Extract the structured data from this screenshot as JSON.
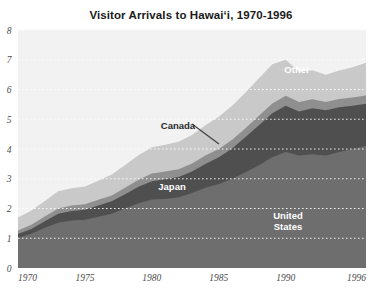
{
  "chart_data": {
    "type": "area",
    "stacked": true,
    "title": "Visitor Arrivals to Hawai‘i, 1970-1996",
    "xlabel": "",
    "ylabel": "",
    "xlim": [
      1970,
      1996
    ],
    "ylim": [
      0,
      8
    ],
    "grid": true,
    "grid_style": "dotted-white-horizontal",
    "legend_position": "inline-annotations",
    "x": [
      1970,
      1971,
      1972,
      1973,
      1974,
      1975,
      1976,
      1977,
      1978,
      1979,
      1980,
      1981,
      1982,
      1983,
      1984,
      1985,
      1986,
      1987,
      1988,
      1989,
      1990,
      1991,
      1992,
      1993,
      1994,
      1995,
      1996
    ],
    "xticks": [
      1970,
      1975,
      1980,
      1985,
      1990,
      1996
    ],
    "xticklabels": [
      "1970",
      "1975",
      "1980",
      "1985",
      "1990",
      "1996"
    ],
    "yticks": [
      0,
      1,
      2,
      3,
      4,
      5,
      6,
      7,
      8
    ],
    "yticklabels": [
      "0",
      "1",
      "2",
      "3",
      "4",
      "5",
      "6",
      "7",
      "8"
    ],
    "series": [
      {
        "name": "United States",
        "color": "#6e6e6e",
        "label_color": "#ffffff",
        "values": [
          1.02,
          1.15,
          1.35,
          1.52,
          1.6,
          1.62,
          1.72,
          1.82,
          2.0,
          2.18,
          2.3,
          2.32,
          2.38,
          2.52,
          2.7,
          2.82,
          3.0,
          3.22,
          3.45,
          3.72,
          3.9,
          3.78,
          3.82,
          3.78,
          3.9,
          4.0,
          4.1
        ]
      },
      {
        "name": "Japan",
        "color": "#4f4f4f",
        "label_color": "#ffffff",
        "values": [
          0.12,
          0.16,
          0.22,
          0.3,
          0.32,
          0.34,
          0.38,
          0.42,
          0.48,
          0.55,
          0.62,
          0.66,
          0.68,
          0.72,
          0.8,
          0.9,
          1.02,
          1.18,
          1.35,
          1.48,
          1.55,
          1.48,
          1.55,
          1.52,
          1.5,
          1.45,
          1.42
        ]
      },
      {
        "name": "Canada",
        "color": "#8f8f8f",
        "label_color": "#2b2b2b",
        "values": [
          0.12,
          0.14,
          0.16,
          0.18,
          0.18,
          0.18,
          0.19,
          0.2,
          0.22,
          0.24,
          0.26,
          0.26,
          0.26,
          0.27,
          0.28,
          0.28,
          0.29,
          0.3,
          0.32,
          0.33,
          0.34,
          0.32,
          0.3,
          0.28,
          0.28,
          0.28,
          0.28
        ]
      },
      {
        "name": "Other",
        "color": "#c9c9c9",
        "label_color": "#ffffff",
        "values": [
          0.44,
          0.48,
          0.52,
          0.58,
          0.58,
          0.6,
          0.64,
          0.7,
          0.76,
          0.82,
          0.88,
          0.9,
          0.92,
          0.96,
          1.02,
          1.08,
          1.14,
          1.2,
          1.26,
          1.32,
          1.21,
          1.02,
          0.98,
          0.92,
          0.96,
          1.02,
          1.1
        ]
      }
    ],
    "annotations": [
      {
        "text": "Other",
        "series": "Other",
        "x_px": 297,
        "y_px": 73,
        "style": "light"
      },
      {
        "text": "Canada",
        "series": "Canada",
        "x_px": 178,
        "y_px": 129,
        "style": "dark"
      },
      {
        "text": "Japan",
        "series": "Japan",
        "x_px": 172,
        "y_px": 190,
        "style": "light"
      },
      {
        "text": "United",
        "series": "United States",
        "x_px": 288,
        "y_px": 219,
        "style": "light"
      },
      {
        "text": "States",
        "series": "United States",
        "x_px": 288,
        "y_px": 230,
        "style": "light"
      }
    ],
    "leader_line": {
      "from_x": 192,
      "from_y": 124,
      "to_x": 219,
      "to_y": 144,
      "color": "#3d3d3d"
    },
    "plot_background": "#f2f2f2",
    "page_background": "#ffffff",
    "gridline_color": "#ffffff"
  }
}
